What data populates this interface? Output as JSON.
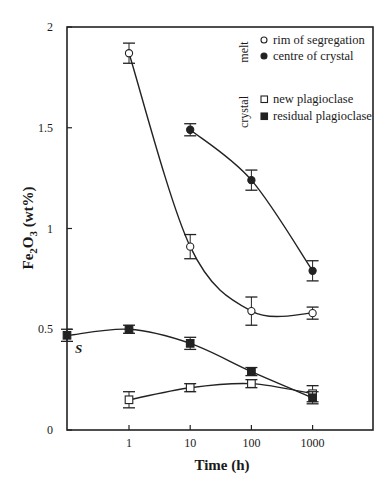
{
  "chart_data": {
    "type": "scatter",
    "title": "",
    "xlabel": "Time (h)",
    "ylabel": "Fe2O3 (wt%)",
    "ylabel_parts": {
      "fe": "Fe",
      "sub2": "2",
      "o": "O",
      "sub3": "3",
      "unit": " (wt%)"
    },
    "xscale": "log",
    "xlim": [
      0.2,
      10000
    ],
    "ylim": [
      0,
      2
    ],
    "x_ticks": [
      1,
      10,
      100,
      1000
    ],
    "x_tick_labels": [
      "1",
      "10",
      "100",
      "1000"
    ],
    "y_ticks": [
      0,
      0.5,
      1,
      1.5,
      2
    ],
    "y_tick_labels": [
      "0",
      "0.5",
      "1",
      "1.5",
      "2"
    ],
    "grid": false,
    "legend_position": "upper right",
    "legend_groups": [
      {
        "group": "melt",
        "entries": [
          "rim of segregation",
          "centre of crystal"
        ]
      },
      {
        "group": "crystal",
        "entries": [
          "new plagioclase",
          "residual plagioclase"
        ]
      }
    ],
    "annotations": [
      {
        "text": "S",
        "x": 0.2,
        "y": 0.47,
        "note": "starting material"
      }
    ],
    "series": [
      {
        "name": "rim of segregation",
        "group": "melt",
        "marker": "open-circle",
        "x": [
          1,
          10,
          100,
          1000
        ],
        "y": [
          1.87,
          0.91,
          0.59,
          0.58
        ],
        "err": [
          0.05,
          0.06,
          0.07,
          0.03
        ],
        "fit_curve": true
      },
      {
        "name": "centre of crystal",
        "group": "melt",
        "marker": "filled-circle",
        "x": [
          10,
          100,
          1000
        ],
        "y": [
          1.49,
          1.24,
          0.79
        ],
        "err": [
          0.03,
          0.05,
          0.05
        ],
        "fit_curve": true
      },
      {
        "name": "new plagioclase",
        "group": "crystal",
        "marker": "open-square",
        "x": [
          1,
          10,
          100,
          1000
        ],
        "y": [
          0.15,
          0.21,
          0.23,
          0.18
        ],
        "err": [
          0.04,
          0.02,
          0.02,
          0.04
        ],
        "fit_curve": true
      },
      {
        "name": "residual plagioclase",
        "group": "crystal",
        "marker": "filled-square",
        "x": [
          0.2,
          1,
          10,
          100,
          1000
        ],
        "y": [
          0.47,
          0.5,
          0.43,
          0.29,
          0.16
        ],
        "err": [
          0.03,
          0.02,
          0.03,
          0.02,
          0.03
        ],
        "fit_curve": true
      }
    ]
  }
}
